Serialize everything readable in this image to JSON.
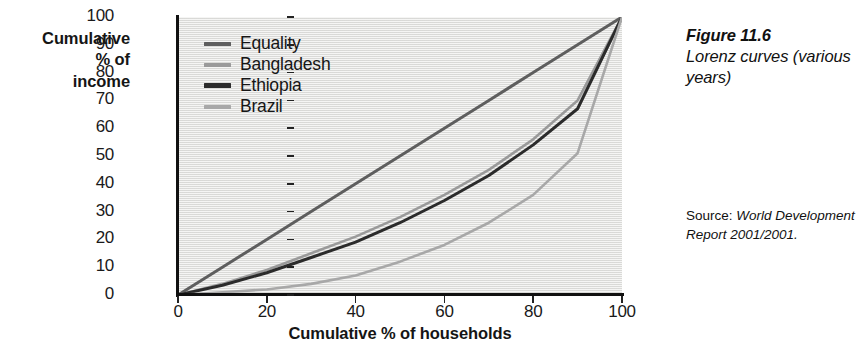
{
  "figure": {
    "number": "Figure 11.6",
    "caption": "Lorenz curves (various years)",
    "source_prefix": "Source: ",
    "source_italic": "World Development Report 2001/2001."
  },
  "axes": {
    "y_title": "Cumulative % of income",
    "y_title_line1": "Cumulative",
    "y_title_line2": "% of",
    "y_title_line3": "income",
    "x_title": "Cumulative % of households",
    "y_ticks": [
      "0",
      "10",
      "20",
      "30",
      "40",
      "50",
      "60",
      "70",
      "80",
      "90",
      "100"
    ],
    "x_ticks": [
      "0",
      "20",
      "40",
      "60",
      "80",
      "100"
    ]
  },
  "legend": {
    "items": [
      {
        "label": "Equality",
        "color": "#5e5e5e"
      },
      {
        "label": "Bangladesh",
        "color": "#9a9a9a"
      },
      {
        "label": "Ethiopia",
        "color": "#2b2b2b"
      },
      {
        "label": "Brazil",
        "color": "#a8a8a8"
      }
    ]
  },
  "colors": {
    "plot_background": "#e9e9e7",
    "axis": "#111111",
    "text": "#151515",
    "equality": "#5e5e5e",
    "bangladesh": "#9a9a9a",
    "ethiopia": "#2b2b2b",
    "brazil": "#a8a8a8"
  },
  "chart_data": {
    "type": "line",
    "title": "Lorenz curves (various years)",
    "xlabel": "Cumulative % of households",
    "ylabel": "Cumulative % of income",
    "xlim": [
      0,
      100
    ],
    "ylim": [
      0,
      100
    ],
    "xticks": [
      0,
      20,
      40,
      60,
      80,
      100
    ],
    "yticks": [
      0,
      10,
      20,
      30,
      40,
      50,
      60,
      70,
      80,
      90,
      100
    ],
    "grid": false,
    "legend_position": "upper-left-inside",
    "series": [
      {
        "name": "Equality",
        "color": "#5e5e5e",
        "linewidth": 3.0,
        "x": [
          0,
          10,
          20,
          30,
          40,
          50,
          60,
          70,
          80,
          90,
          100
        ],
        "values": [
          0,
          10,
          20,
          30,
          40,
          50,
          60,
          70,
          80,
          90,
          100
        ]
      },
      {
        "name": "Bangladesh",
        "color": "#9a9a9a",
        "linewidth": 2.6,
        "x": [
          0,
          10,
          20,
          30,
          40,
          50,
          60,
          70,
          80,
          90,
          100
        ],
        "values": [
          0,
          4,
          9,
          15,
          21,
          28,
          36,
          45,
          56,
          70,
          100
        ]
      },
      {
        "name": "Ethiopia",
        "color": "#2b2b2b",
        "linewidth": 3.0,
        "x": [
          0,
          10,
          20,
          30,
          40,
          50,
          60,
          70,
          80,
          90,
          100
        ],
        "values": [
          0,
          3.5,
          8,
          13.5,
          19,
          26,
          34,
          43,
          54,
          67,
          100
        ]
      },
      {
        "name": "Brazil",
        "color": "#a8a8a8",
        "linewidth": 2.6,
        "x": [
          0,
          10,
          20,
          30,
          40,
          50,
          60,
          70,
          80,
          90,
          100
        ],
        "values": [
          0,
          1,
          2,
          4,
          7,
          12,
          18,
          26,
          36,
          51,
          100
        ]
      }
    ]
  }
}
